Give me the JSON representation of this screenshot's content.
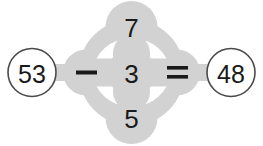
{
  "canvas": {
    "width": 263,
    "height": 146,
    "background_color": "#ffffff"
  },
  "colors": {
    "blob_gray": "#d2d2d2",
    "hole_white": "#ffffff",
    "text_dark": "#1a1a1a",
    "circle_outline": "#4a4a4a"
  },
  "equation": {
    "left_operand": "53",
    "operator": "−",
    "operator_name": "minus-sign",
    "equals": "=",
    "equals_name": "equals-sign",
    "right_operand": "48"
  },
  "nodes": {
    "top": {
      "value": "7",
      "label": "top-number-node"
    },
    "center": {
      "value": "3",
      "label": "center-number-node"
    },
    "bottom": {
      "value": "5",
      "label": "bottom-number-node"
    },
    "left_endpoint": {
      "value": "53",
      "label": "left-endpoint-node"
    },
    "right_endpoint": {
      "value": "48",
      "label": "right-endpoint-node"
    }
  }
}
